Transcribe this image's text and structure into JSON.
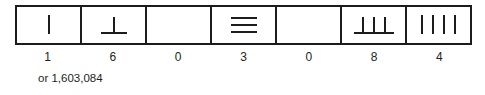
{
  "figure": {
    "type": "positional-numeral-diagram",
    "caption": "or 1,603,084",
    "cells": [
      {
        "digit": "1",
        "glyph_name": "one-vertical-stroke",
        "bars": 0,
        "strokes": 1,
        "value": 1
      },
      {
        "digit": "6",
        "glyph_name": "bar-with-one-stroke",
        "bars": 1,
        "strokes": 1,
        "value": 6
      },
      {
        "digit": "0",
        "glyph_name": "empty-cell",
        "bars": 0,
        "strokes": 0,
        "value": 0
      },
      {
        "digit": "3",
        "glyph_name": "three-horizontal-bars",
        "bars": 3,
        "strokes": 0,
        "value": 3
      },
      {
        "digit": "0",
        "glyph_name": "empty-cell",
        "bars": 0,
        "strokes": 0,
        "value": 0
      },
      {
        "digit": "8",
        "glyph_name": "bar-with-three-strokes",
        "bars": 1,
        "strokes": 3,
        "value": 8
      },
      {
        "digit": "4",
        "glyph_name": "four-vertical-strokes",
        "bars": 0,
        "strokes": 4,
        "value": 4
      }
    ],
    "colors": {
      "ink": "#1c1c1c",
      "text": "#231f20",
      "background": "#ffffff"
    }
  }
}
